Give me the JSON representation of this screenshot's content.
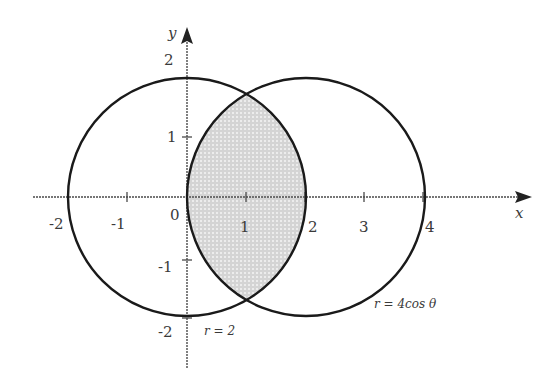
{
  "diagram": {
    "type": "polar-region-diagram",
    "axes": {
      "x_label": "x",
      "y_label": "y",
      "origin_label": "0",
      "x_ticks": [
        "-2",
        "-1",
        "1",
        "2",
        "3",
        "4"
      ],
      "y_ticks": [
        "2",
        "1",
        "-1",
        "-2"
      ]
    },
    "curves": [
      {
        "name": "circle-r-2",
        "label": "r = 2",
        "center": [
          0,
          0
        ],
        "radius": 2
      },
      {
        "name": "circle-r-4cos",
        "label": "r = 4cos θ",
        "center": [
          2,
          0
        ],
        "radius": 2
      }
    ],
    "shaded_region": {
      "description": "Lens-shaped overlap of both circles",
      "intersections": [
        [
          1,
          1.732
        ],
        [
          1,
          -1.732
        ]
      ],
      "fill": "#d8d8d8"
    },
    "colors": {
      "curve": "#1a1a1a",
      "axis": "#4a4a4a",
      "shade": "#d9d9d9",
      "text": "#3a3a3a"
    }
  }
}
